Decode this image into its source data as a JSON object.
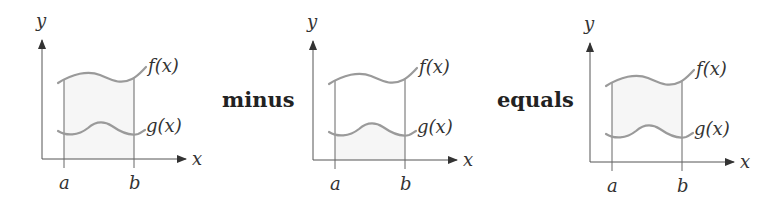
{
  "diagram": {
    "panels": [
      {
        "id": "panel-1",
        "offset_x": 0,
        "offset_y": 0,
        "labels": {
          "y_axis": "y",
          "x_axis": "x",
          "a": "a",
          "b": "b",
          "f": "f(x)",
          "g": "g(x)"
        }
      },
      {
        "id": "panel-2",
        "offset_x": 271,
        "offset_y": 1,
        "labels": {
          "y_axis": "y",
          "x_axis": "x",
          "a": "a",
          "b": "b",
          "f": "f(x)",
          "g": "g(x)"
        }
      },
      {
        "id": "panel-3",
        "offset_x": 548,
        "offset_y": 3,
        "labels": {
          "y_axis": "y",
          "x_axis": "x",
          "a": "a",
          "b": "b",
          "f": "f(x)",
          "g": "g(x)"
        }
      }
    ],
    "operators": {
      "minus": "minus",
      "equals": "equals"
    },
    "colors": {
      "curve": "#9a9a9a",
      "axis": "#555555",
      "text": "#333333",
      "shade": "#f6f6f6"
    }
  }
}
